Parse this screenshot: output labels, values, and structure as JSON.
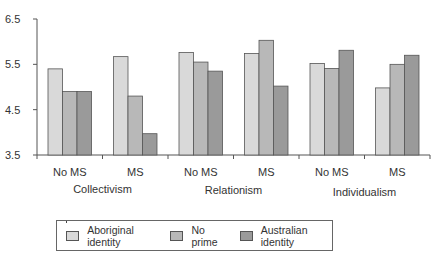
{
  "chart_data": {
    "type": "bar",
    "title": "",
    "xlabel": "",
    "ylabel": "",
    "ylim": [
      3.5,
      6.5
    ],
    "yticks": [
      "3.5",
      "4.5",
      "5.5",
      "6.5"
    ],
    "grid": false,
    "legend_position": "bottom",
    "groups": [
      "Collectivism",
      "Relationism",
      "Individualism"
    ],
    "categories": [
      "No MS",
      "MS",
      "No MS",
      "MS",
      "No MS",
      "MS"
    ],
    "series": [
      {
        "name": "Aboriginal identity",
        "color": "#d9d9d9",
        "values": [
          5.4,
          5.67,
          5.76,
          5.74,
          5.52,
          4.98
        ]
      },
      {
        "name": "No prime",
        "color": "#b8b8b8",
        "values": [
          4.9,
          4.8,
          5.55,
          6.03,
          5.41,
          5.5
        ]
      },
      {
        "name": "Australian identity",
        "color": "#9a9a9a",
        "values": [
          4.9,
          3.97,
          5.35,
          5.02,
          5.81,
          5.7
        ]
      }
    ]
  },
  "legend": {
    "items": [
      {
        "label": "Aboriginal identity",
        "color": "#d9d9d9"
      },
      {
        "label": "No prime",
        "color": "#b8b8b8"
      },
      {
        "label": "Australian identity",
        "color": "#9a9a9a"
      }
    ]
  }
}
